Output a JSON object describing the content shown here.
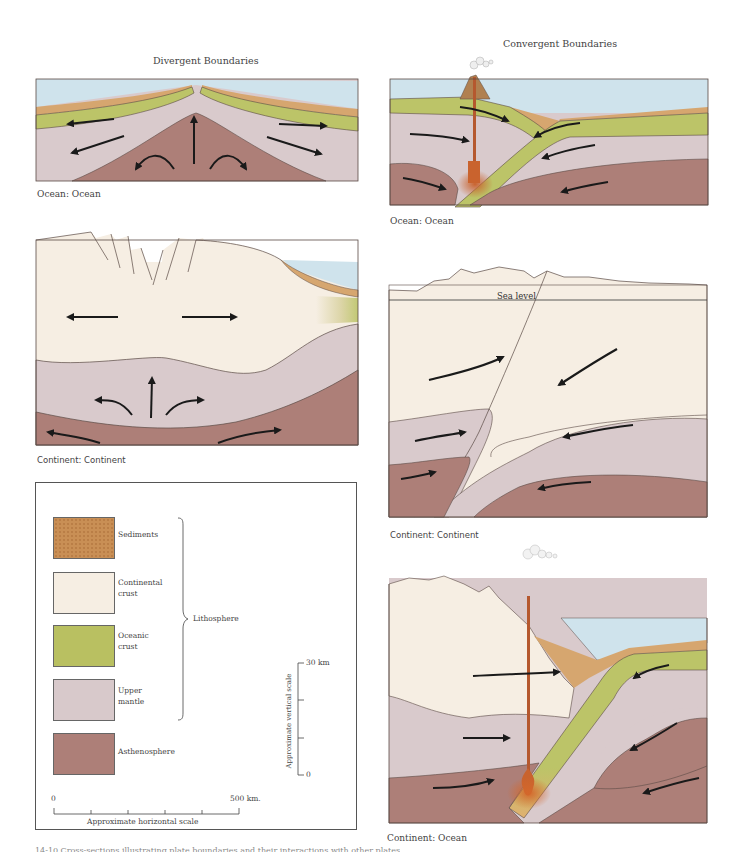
{
  "figure": {
    "section_titles": {
      "divergent": "Divergent Boundaries",
      "convergent": "Convergent Boundaries"
    },
    "panels": [
      {
        "id": "divergent-ocean-ocean",
        "column": "divergent",
        "caption": "Ocean: Ocean"
      },
      {
        "id": "divergent-continent-continent",
        "column": "divergent",
        "caption": "Continent: Continent"
      },
      {
        "id": "convergent-ocean-ocean",
        "column": "convergent",
        "caption": "Ocean: Ocean"
      },
      {
        "id": "convergent-continent-continent",
        "column": "convergent",
        "caption": "Continent: Continent",
        "annotation": "Sea level"
      },
      {
        "id": "convergent-continent-ocean",
        "column": "convergent",
        "caption": "Continent: Ocean"
      }
    ],
    "legend": {
      "items": [
        {
          "label_line1": "Sediments",
          "label_line2": "",
          "color": "#c98f55"
        },
        {
          "label_line1": "Continental",
          "label_line2": "crust",
          "color": "#f6eee3"
        },
        {
          "label_line1": "Oceanic",
          "label_line2": "crust",
          "color": "#b9c061"
        },
        {
          "label_line1": "Upper",
          "label_line2": "mantle",
          "color": "#d8c9cb"
        },
        {
          "label_line1": "Asthenosphere",
          "label_line2": "",
          "color": "#ad7f78"
        }
      ],
      "group_label": "Lithosphere",
      "vertical_scale": {
        "label": "Approximate vertical scale",
        "top": "30 km",
        "bottom": "0"
      },
      "horizontal_scale": {
        "label": "Approximate horizontal scale",
        "left": "0",
        "right": "500 km."
      }
    },
    "colors": {
      "water": "#cfe3ec",
      "sediment": "#d6a66f",
      "continental_crust": "#f6eee3",
      "oceanic_crust": "#bcc468",
      "upper_mantle": "#d9cacc",
      "asthenosphere": "#ad7f78",
      "magma": "#b5582e",
      "outline": "#5a4a45",
      "arrow": "#1a1a1a"
    },
    "bottom_caption": "14-10 Cross-sections illustrating plate boundaries and their interactions with other plates"
  }
}
